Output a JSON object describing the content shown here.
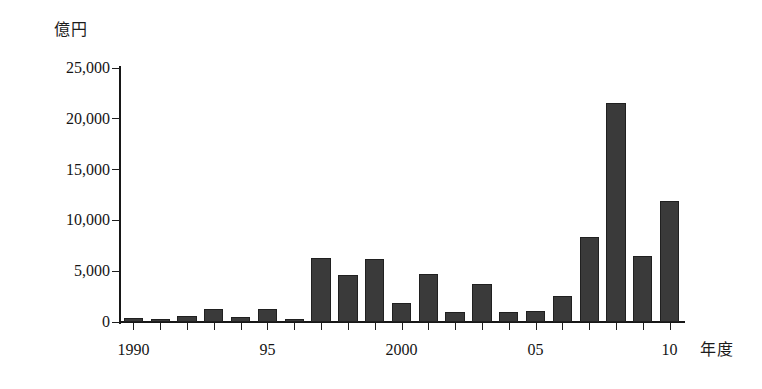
{
  "chart_data": {
    "type": "bar",
    "title": "",
    "subtitle": "",
    "xlabel": "年度",
    "ylabel": "億円",
    "categories": [
      "1990",
      "1991",
      "1992",
      "1993",
      "1994",
      "1995",
      "1996",
      "1997",
      "1998",
      "1999",
      "2000",
      "2001",
      "2002",
      "2003",
      "2004",
      "2005",
      "2006",
      "2007",
      "2008",
      "2009",
      "2010"
    ],
    "values": [
      400,
      300,
      600,
      1300,
      500,
      1300,
      300,
      6300,
      4600,
      6200,
      1900,
      4700,
      1000,
      3700,
      1000,
      1100,
      2600,
      8400,
      21600,
      6500,
      11900
    ],
    "ylim": [
      0,
      25000
    ],
    "ytick_values": [
      0,
      5000,
      10000,
      15000,
      20000,
      25000
    ],
    "ytick_labels": [
      "0",
      "5,000",
      "10,000",
      "15,000",
      "20,000",
      "25,000"
    ],
    "xtick_labels": [
      {
        "index": 0,
        "label": "1990"
      },
      {
        "index": 5,
        "label": "95"
      },
      {
        "index": 10,
        "label": "2000"
      },
      {
        "index": 15,
        "label": "05"
      },
      {
        "index": 20,
        "label": "10"
      }
    ],
    "grid": false,
    "legend": null,
    "bar_color": "#3a3a3a",
    "axis_color": "#171717"
  }
}
